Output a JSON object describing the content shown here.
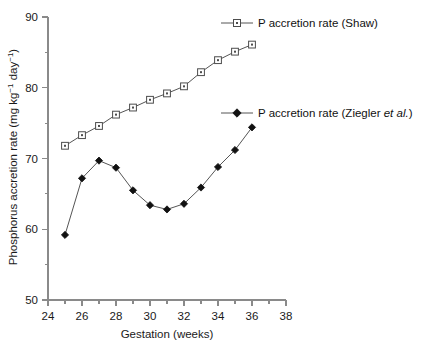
{
  "chart_data": {
    "type": "line",
    "title": "",
    "xlabel": "Gestation (weeks)",
    "ylabel": "Phosphorus accretion rate (mg kg⁻¹ day⁻¹)",
    "ylabel_parts": {
      "main": "Phosphorus accretion rate (mg kg",
      "sup1": "−1",
      "mid": " day",
      "sup2": "−1",
      "tail": ")"
    },
    "xlim": [
      24,
      38
    ],
    "ylim": [
      50,
      90
    ],
    "xticks": [
      24,
      26,
      28,
      30,
      32,
      34,
      36,
      38
    ],
    "xtick_labels": [
      "24",
      "26",
      "28",
      "30",
      "32",
      "34",
      "36",
      "38"
    ],
    "xminor_ticks": [
      25,
      27,
      29,
      31,
      33,
      35,
      37
    ],
    "yticks": [
      50,
      60,
      70,
      80,
      90
    ],
    "ytick_labels": [
      "50",
      "60",
      "70",
      "80",
      "90"
    ],
    "yminor_ticks": [
      55,
      65,
      75,
      85
    ],
    "grid": false,
    "legend_position": "inside-right",
    "x": [
      25,
      26,
      27,
      28,
      29,
      30,
      31,
      32,
      33,
      34,
      35,
      36
    ],
    "series": [
      {
        "name": "P accretion rate (Shaw)",
        "marker": "open-square",
        "color": "#4d4d4d",
        "values": [
          71.8,
          73.3,
          74.6,
          76.2,
          77.2,
          78.3,
          79.2,
          80.2,
          82.2,
          83.9,
          85.1,
          86.1
        ]
      },
      {
        "name": "P accretion rate (Ziegler et al.)",
        "marker": "filled-diamond",
        "color": "#111111",
        "values": [
          59.2,
          67.2,
          69.7,
          68.7,
          65.5,
          63.4,
          62.8,
          63.6,
          65.9,
          68.8,
          71.2,
          74.4
        ]
      }
    ],
    "legend": [
      {
        "label": "P accretion rate (Shaw)",
        "label_plain": "P accretion rate (Shaw)",
        "marker": "open-square"
      },
      {
        "label_pre": "P accretion rate (Ziegler ",
        "label_italic": "et al.",
        "label_post": ")",
        "marker": "filled-diamond"
      }
    ]
  }
}
